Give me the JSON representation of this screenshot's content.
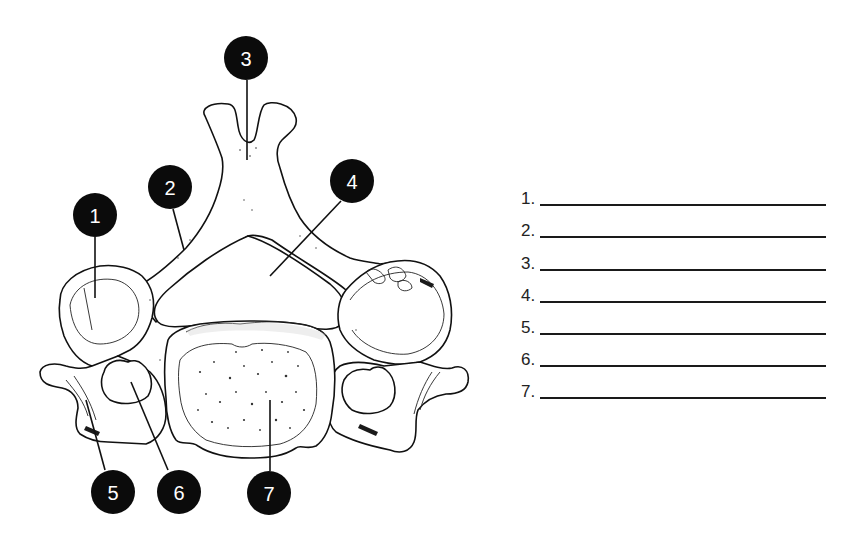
{
  "diagram": {
    "callouts": [
      {
        "number": "1",
        "cx": 95,
        "cy": 215,
        "leader": [
          [
            95,
            237
          ],
          [
            95,
            298
          ]
        ]
      },
      {
        "number": "2",
        "cx": 170,
        "cy": 187,
        "leader": [
          [
            173,
            209
          ],
          [
            184,
            250
          ]
        ]
      },
      {
        "number": "3",
        "cx": 246,
        "cy": 58,
        "leader": [
          [
            247,
            80
          ],
          [
            247,
            160
          ]
        ]
      },
      {
        "number": "4",
        "cx": 352,
        "cy": 181,
        "leader": [
          [
            341,
            201
          ],
          [
            270,
            276
          ]
        ]
      },
      {
        "number": "5",
        "cx": 113,
        "cy": 492,
        "leader": [
          [
            105,
            470
          ],
          [
            86,
            400
          ]
        ]
      },
      {
        "number": "6",
        "cx": 179,
        "cy": 492,
        "leader": [
          [
            168,
            470
          ],
          [
            131,
            382
          ]
        ]
      },
      {
        "number": "7",
        "cx": 269,
        "cy": 493,
        "leader": [
          [
            270,
            471
          ],
          [
            270,
            400
          ]
        ]
      }
    ]
  },
  "answer_sheet": {
    "items": [
      {
        "label": "1.",
        "value": ""
      },
      {
        "label": "2.",
        "value": ""
      },
      {
        "label": "3.",
        "value": ""
      },
      {
        "label": "4.",
        "value": ""
      },
      {
        "label": "5.",
        "value": ""
      },
      {
        "label": "6.",
        "value": ""
      },
      {
        "label": "7.",
        "value": ""
      }
    ]
  },
  "colors": {
    "ink": "#0b0b0b",
    "paper": "#ffffff"
  }
}
